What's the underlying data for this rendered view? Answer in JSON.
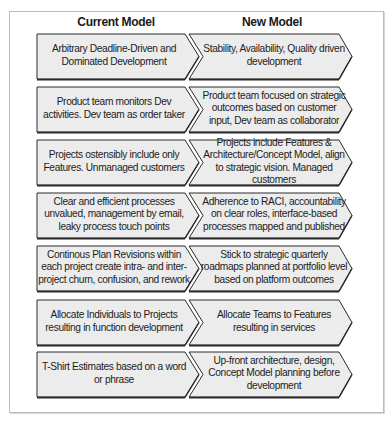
{
  "headers": {
    "current": "Current Model",
    "new": "New Model"
  },
  "colors": {
    "fill": "#ececec",
    "stroke": "#2a2a2a",
    "frame": "#bdbdbd"
  },
  "rows": [
    {
      "current": "Arbitrary Deadline-Driven and Dominated Development",
      "new": "Stability, Availability, Quality driven development"
    },
    {
      "current": "Product team monitors Dev activities. Dev team as order taker",
      "new": "Product team focused on strategic outcomes based on customer input, Dev team as collaborator"
    },
    {
      "current": "Projects ostensibly include only Features. Unmanaged customers",
      "new": "Projects include Features & Architecture/Concept Model, align to strategic vision. Managed customers"
    },
    {
      "current": "Clear and efficient processes unvalued, management by email, leaky process touch points",
      "new": "Adherence to RACI, accountability on clear roles, interface-based processes mapped and published"
    },
    {
      "current": "Continous Plan Revisions within each project create intra- and inter-project churn, confusion, and rework",
      "new": "Stick to strategic quarterly roadmaps planned at portfolio level based on platform outcomes"
    },
    {
      "current": "Allocate Individuals to Projects resulting in function development",
      "new": "Allocate Teams to Features resulting in services"
    },
    {
      "current": "T-Shirt Estimates based on a word or phrase",
      "new": "Up-front architecture, design, Concept Model planning before development"
    }
  ]
}
